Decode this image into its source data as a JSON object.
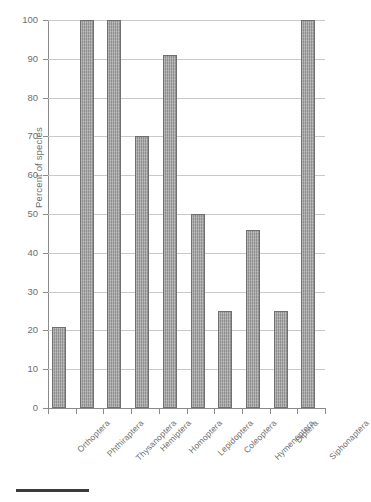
{
  "chart_data": {
    "type": "bar",
    "title": "",
    "xlabel": "",
    "ylabel": "Percent of species",
    "ylim": [
      0,
      100
    ],
    "ytick_step": 10,
    "yticks": [
      "100",
      "90",
      "80",
      "70",
      "60",
      "50",
      "40",
      "30",
      "20",
      "10",
      "0"
    ],
    "grid": true,
    "legend": false,
    "orientation": "vertical",
    "bar_color": "#8e8e8e",
    "bar_edge_color": "#707070",
    "background_color": "#ffffff",
    "axis_color": "#8a8a8a",
    "gridline_color": "#c9c9c9",
    "categories": [
      "Orthoptera",
      "Phthiraptera",
      "Thysanoptera",
      "Hemiptera",
      "Homoptera",
      "Lepidoptera",
      "Coleoptera",
      "Hymenoptera",
      "Diptera",
      "Siphonaptera"
    ],
    "values": [
      21,
      100,
      100,
      70,
      91,
      50,
      25,
      46,
      25,
      100
    ]
  },
  "footer": {
    "rule_color": "#3a3a3a"
  }
}
